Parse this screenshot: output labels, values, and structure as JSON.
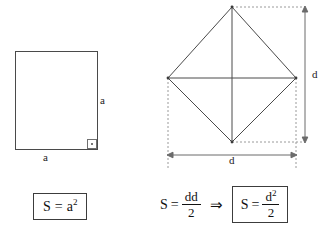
{
  "canvas": {
    "width": 330,
    "height": 240,
    "background": "#ffffff"
  },
  "colors": {
    "stroke": "#4a4a4a",
    "dashed": "#8c8c8c",
    "dimension": "#6b6b6b",
    "text": "#111111",
    "box_border": "#3c3c3c"
  },
  "square_figure": {
    "name": "square",
    "label_side_right": "a",
    "label_side_bottom": "a",
    "right_angle_marker": "right-angle",
    "geometry": {
      "x": 15,
      "y": 51,
      "width": 83,
      "height": 99
    },
    "formula": {
      "boxed": true,
      "area_symbol": "S",
      "equals": "=",
      "base": "a",
      "exponent": "2",
      "full_text": "S = a2"
    }
  },
  "rhombus_figure": {
    "name": "rhombus",
    "vertices": {
      "top": [
        232,
        7
      ],
      "left": [
        168,
        78
      ],
      "right": [
        296,
        78
      ],
      "bottom": [
        232,
        142
      ]
    },
    "diagonals": [
      "horizontal",
      "vertical"
    ],
    "dimension_vertical_label": "d",
    "dimension_horizontal_label": "d",
    "formula_plain": {
      "area_symbol": "S",
      "equals": "=",
      "numerator": "dd",
      "denominator": "2",
      "full_text": "S = dd/2"
    },
    "implies_symbol": "⇒",
    "formula_boxed": {
      "boxed": true,
      "area_symbol": "S",
      "equals": "=",
      "numerator_base": "d",
      "numerator_exponent": "2",
      "denominator": "2",
      "full_text": "S = d2/2"
    }
  }
}
